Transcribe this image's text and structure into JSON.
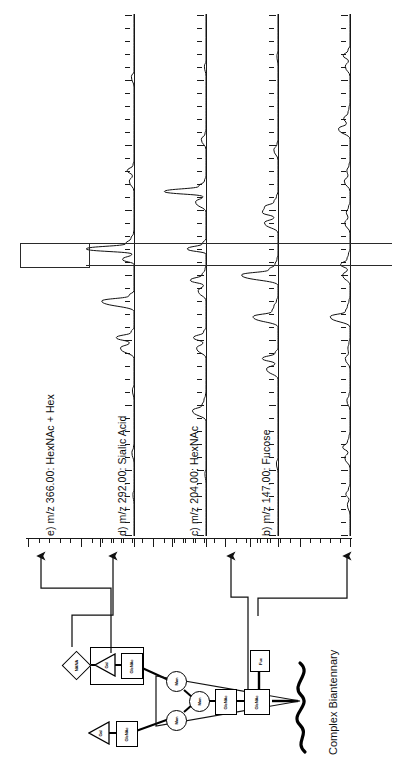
{
  "figure": {
    "orientation": "rotated-90",
    "background": "#ffffff",
    "ink": "#111111"
  },
  "panels": [
    {
      "id": "e",
      "caption": "e) m/z 366.00: HexNAc + Hex",
      "mz": "366.00",
      "fragment": "HexNAc + Hex",
      "letter": "e)"
    },
    {
      "id": "d",
      "caption": "d) m/z 292.00: Sialic Acid",
      "mz": "292.00",
      "fragment": "Sialic Acid",
      "letter": "d)"
    },
    {
      "id": "c",
      "caption": "c) m/z 204.00: HexNAc",
      "mz": "204.00",
      "fragment": "HexNAc",
      "letter": "c)"
    },
    {
      "id": "b",
      "caption": "b) m/z 147.00: Fucose",
      "mz": "147.00",
      "fragment": "Fucose",
      "letter": "b)"
    }
  ],
  "glycan": {
    "name": "Complex Biantennary",
    "residues": [
      {
        "key": "nana",
        "label": "NANA",
        "shape": "diamond"
      },
      {
        "key": "gal_up",
        "label": "Gal",
        "shape": "triangle"
      },
      {
        "key": "glcnac_up",
        "label": "GlcNAc",
        "shape": "square"
      },
      {
        "key": "gal_lo",
        "label": "Gal",
        "shape": "triangle"
      },
      {
        "key": "glcnac_lo",
        "label": "GlcNAc",
        "shape": "square"
      },
      {
        "key": "man_a",
        "label": "Man",
        "shape": "circle"
      },
      {
        "key": "man_b",
        "label": "Man",
        "shape": "circle"
      },
      {
        "key": "man_c",
        "label": "Man",
        "shape": "circle"
      },
      {
        "key": "glcnac_core2",
        "label": "GlcNAc",
        "shape": "square"
      },
      {
        "key": "glcnac_core1",
        "label": "GlcNAc",
        "shape": "square"
      },
      {
        "key": "fuc",
        "label": "Fuc",
        "shape": "square"
      }
    ]
  },
  "chart_data": {
    "type": "line",
    "xlabel": "Retention Time",
    "ylabel": "Relative Intensity",
    "grid": false,
    "legend": "none",
    "annotations": [
      "Highlight box marks the co-eluting retention-time window shared by all four fragment traces.",
      "Arrows connect each extracted fragment mass to the monosaccharide it reports on in the Complex Biantennary glycan."
    ],
    "series": [
      {
        "name": "e) m/z 366.00: HexNAc + Hex",
        "mz": 366.0,
        "xlim": [
          0,
          100
        ],
        "ylim": [
          0,
          100
        ],
        "points": [
          [
            0,
            0
          ],
          [
            6,
            0
          ],
          [
            8,
            2
          ],
          [
            9,
            0
          ],
          [
            14,
            0
          ],
          [
            16,
            4
          ],
          [
            17,
            1
          ],
          [
            18,
            0
          ],
          [
            26,
            0
          ],
          [
            28,
            3
          ],
          [
            29,
            0
          ],
          [
            34,
            0
          ],
          [
            36,
            26
          ],
          [
            37,
            9
          ],
          [
            38,
            34
          ],
          [
            39,
            6
          ],
          [
            40,
            0
          ],
          [
            43,
            0
          ],
          [
            45,
            62
          ],
          [
            46,
            10
          ],
          [
            47,
            0
          ],
          [
            52,
            0
          ],
          [
            53,
            22
          ],
          [
            54,
            4
          ],
          [
            55,
            92
          ],
          [
            56,
            16
          ],
          [
            57,
            6
          ],
          [
            58,
            1
          ],
          [
            59,
            0
          ],
          [
            66,
            0
          ],
          [
            68,
            9
          ],
          [
            69,
            3
          ],
          [
            70,
            13
          ],
          [
            71,
            2
          ],
          [
            72,
            0
          ],
          [
            86,
            0
          ],
          [
            88,
            5
          ],
          [
            89,
            0
          ],
          [
            100,
            0
          ]
        ]
      },
      {
        "name": "d) m/z 292.00: Sialic Acid",
        "mz": 292.0,
        "xlim": [
          0,
          100
        ],
        "ylim": [
          0,
          100
        ],
        "points": [
          [
            0,
            0
          ],
          [
            10,
            0
          ],
          [
            12,
            2
          ],
          [
            13,
            0
          ],
          [
            22,
            0
          ],
          [
            24,
            26
          ],
          [
            25,
            8
          ],
          [
            26,
            4
          ],
          [
            27,
            1
          ],
          [
            28,
            0
          ],
          [
            34,
            0
          ],
          [
            36,
            18
          ],
          [
            37,
            6
          ],
          [
            38,
            24
          ],
          [
            39,
            5
          ],
          [
            40,
            0
          ],
          [
            45,
            0
          ],
          [
            47,
            15
          ],
          [
            48,
            5
          ],
          [
            49,
            30
          ],
          [
            50,
            8
          ],
          [
            51,
            2
          ],
          [
            52,
            0
          ],
          [
            54,
            0
          ],
          [
            55,
            36
          ],
          [
            56,
            7
          ],
          [
            57,
            0
          ],
          [
            62,
            0
          ],
          [
            64,
            20
          ],
          [
            65,
            6
          ],
          [
            66,
            80
          ],
          [
            67,
            14
          ],
          [
            68,
            3
          ],
          [
            69,
            0
          ],
          [
            74,
            0
          ],
          [
            76,
            9
          ],
          [
            77,
            2
          ],
          [
            78,
            0
          ],
          [
            88,
            0
          ],
          [
            90,
            3
          ],
          [
            91,
            0
          ],
          [
            100,
            0
          ]
        ]
      },
      {
        "name": "c) m/z 204.00: HexNAc",
        "mz": 204.0,
        "xlim": [
          0,
          100
        ],
        "ylim": [
          0,
          100
        ],
        "points": [
          [
            0,
            0
          ],
          [
            12,
            0
          ],
          [
            14,
            3
          ],
          [
            15,
            0
          ],
          [
            30,
            0
          ],
          [
            32,
            22
          ],
          [
            33,
            6
          ],
          [
            34,
            30
          ],
          [
            35,
            6
          ],
          [
            36,
            0
          ],
          [
            40,
            0
          ],
          [
            42,
            48
          ],
          [
            43,
            12
          ],
          [
            44,
            8
          ],
          [
            45,
            3
          ],
          [
            46,
            0
          ],
          [
            48,
            0
          ],
          [
            50,
            70
          ],
          [
            51,
            18
          ],
          [
            52,
            6
          ],
          [
            53,
            2
          ],
          [
            54,
            0
          ],
          [
            58,
            0
          ],
          [
            60,
            26
          ],
          [
            61,
            8
          ],
          [
            62,
            30
          ],
          [
            63,
            26
          ],
          [
            64,
            8
          ],
          [
            65,
            3
          ],
          [
            66,
            0
          ],
          [
            72,
            0
          ],
          [
            74,
            8
          ],
          [
            75,
            2
          ],
          [
            76,
            0
          ],
          [
            90,
            0
          ],
          [
            92,
            2
          ],
          [
            93,
            0
          ],
          [
            100,
            0
          ]
        ]
      },
      {
        "name": "b) m/z 147.00: Fucose",
        "mz": 147.0,
        "xlim": [
          0,
          100
        ],
        "ylim": [
          0,
          100
        ],
        "points": [
          [
            0,
            0
          ],
          [
            4,
            0
          ],
          [
            6,
            5
          ],
          [
            7,
            2
          ],
          [
            8,
            8
          ],
          [
            9,
            3
          ],
          [
            10,
            0
          ],
          [
            13,
            0
          ],
          [
            15,
            10
          ],
          [
            16,
            4
          ],
          [
            17,
            14
          ],
          [
            18,
            5
          ],
          [
            19,
            2
          ],
          [
            20,
            0
          ],
          [
            24,
            0
          ],
          [
            26,
            6
          ],
          [
            27,
            2
          ],
          [
            28,
            0
          ],
          [
            32,
            0
          ],
          [
            34,
            9
          ],
          [
            35,
            3
          ],
          [
            36,
            4
          ],
          [
            37,
            2
          ],
          [
            38,
            0
          ],
          [
            40,
            0
          ],
          [
            42,
            38
          ],
          [
            43,
            9
          ],
          [
            44,
            5
          ],
          [
            45,
            2
          ],
          [
            46,
            0
          ],
          [
            48,
            0
          ],
          [
            50,
            14
          ],
          [
            51,
            5
          ],
          [
            52,
            18
          ],
          [
            53,
            6
          ],
          [
            54,
            3
          ],
          [
            55,
            0
          ],
          [
            58,
            0
          ],
          [
            60,
            10
          ],
          [
            61,
            4
          ],
          [
            62,
            7
          ],
          [
            63,
            3
          ],
          [
            64,
            0
          ],
          [
            66,
            0
          ],
          [
            68,
            11
          ],
          [
            69,
            4
          ],
          [
            70,
            6
          ],
          [
            71,
            2
          ],
          [
            72,
            0
          ],
          [
            76,
            0
          ],
          [
            78,
            22
          ],
          [
            79,
            7
          ],
          [
            80,
            12
          ],
          [
            81,
            4
          ],
          [
            82,
            2
          ],
          [
            83,
            0
          ],
          [
            88,
            0
          ],
          [
            90,
            9
          ],
          [
            91,
            3
          ],
          [
            92,
            13
          ],
          [
            93,
            4
          ],
          [
            94,
            0
          ],
          [
            100,
            0
          ]
        ]
      }
    ]
  }
}
